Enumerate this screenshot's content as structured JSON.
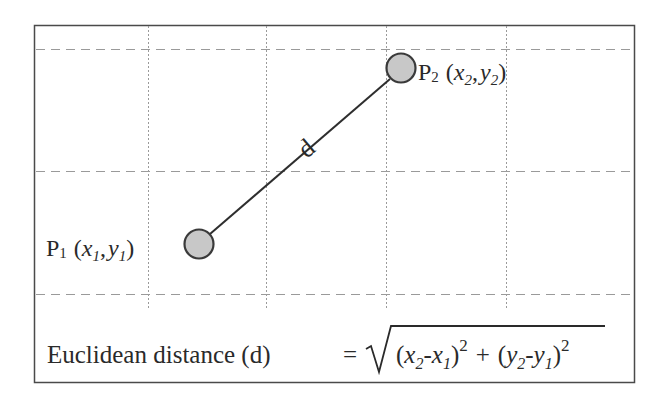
{
  "diagram": {
    "colors": {
      "frame": "#4a4a4a",
      "grid": "#9a9a9a",
      "line": "#2e2e2e",
      "point_fill": "#c8c8c8",
      "point_stroke": "#3a3a3a",
      "text": "#2a2a2a"
    },
    "frame": {
      "x": 34,
      "y": 25,
      "width": 600,
      "height": 357
    },
    "grid": {
      "vertical_x": [
        148,
        266,
        386,
        506
      ],
      "horizontal_y": [
        49,
        171,
        294
      ]
    },
    "points": [
      {
        "id": "p1",
        "label_main": "P",
        "label_sub": "1",
        "coord_x": "x",
        "coord_x_sub": "1",
        "coord_y": "y",
        "coord_y_sub": "1",
        "cx": 199,
        "cy": 244,
        "r": 15
      },
      {
        "id": "p2",
        "label_main": "P",
        "label_sub": "2",
        "coord_x": "x",
        "coord_x_sub": "2",
        "coord_y": "y",
        "coord_y_sub": "2",
        "cx": 401,
        "cy": 68,
        "r": 15
      }
    ],
    "segment_label": "d",
    "formula": {
      "lhs": "Euclidean distance (d)",
      "equals": "=",
      "term1_x2": "x",
      "term1_x2_sub": "2",
      "minus": "-",
      "term1_x1": "x",
      "term1_x1_sub": "1",
      "exponent": "2",
      "plus": "+",
      "term2_y2": "y",
      "term2_y2_sub": "2",
      "term2_y1": "y",
      "term2_y1_sub": "1",
      "open_paren": "(",
      "close_paren": ")"
    }
  }
}
